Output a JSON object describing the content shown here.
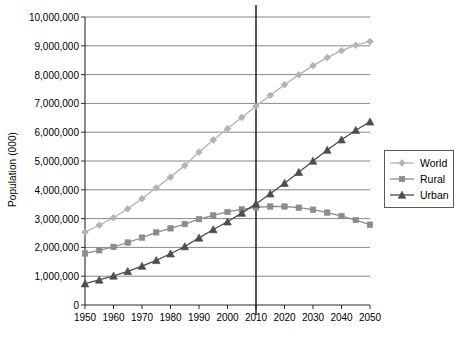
{
  "chart_data": {
    "type": "line",
    "title": "",
    "xlabel": "",
    "ylabel": "Population (000)",
    "xlim": [
      1950,
      2050
    ],
    "ylim": [
      0,
      10000000
    ],
    "grid": true,
    "legend_position": "right",
    "x": [
      1950,
      1955,
      1960,
      1965,
      1970,
      1975,
      1980,
      1985,
      1990,
      1995,
      2000,
      2005,
      2010,
      2015,
      2020,
      2025,
      2030,
      2035,
      2040,
      2045,
      2050
    ],
    "xticks": [
      1950,
      1960,
      1970,
      1980,
      1990,
      2000,
      2010,
      2020,
      2030,
      2040,
      2050
    ],
    "xtick_labels": [
      "1950",
      "1960",
      "1970",
      "1980",
      "1990",
      "2000",
      "2010",
      "2020",
      "2030",
      "2040",
      "2050"
    ],
    "yticks": [
      0,
      1000000,
      2000000,
      3000000,
      4000000,
      5000000,
      6000000,
      7000000,
      8000000,
      9000000,
      10000000
    ],
    "ytick_labels": [
      "0",
      "1,000,000",
      "2,000,000",
      "3,000,000",
      "4,000,000",
      "5,000,000",
      "6,000,000",
      "7,000,000",
      "8,000,000",
      "9,000,000",
      "10,000,000"
    ],
    "annotations": [
      {
        "name": "reference-line-2010",
        "type": "vline",
        "x": 2010
      }
    ],
    "series": [
      {
        "name": "World",
        "marker": "diamond",
        "color": "#b3b3b3",
        "values": [
          2530000,
          2770000,
          3030000,
          3340000,
          3690000,
          4070000,
          4440000,
          4840000,
          5310000,
          5730000,
          6120000,
          6510000,
          6900000,
          7280000,
          7650000,
          7990000,
          8310000,
          8590000,
          8830000,
          9020000,
          9150000
        ]
      },
      {
        "name": "Rural",
        "marker": "square",
        "color": "#8c8c8c",
        "values": [
          1790000,
          1900000,
          2020000,
          2170000,
          2340000,
          2520000,
          2660000,
          2810000,
          2980000,
          3110000,
          3230000,
          3320000,
          3390000,
          3420000,
          3420000,
          3380000,
          3310000,
          3210000,
          3090000,
          2950000,
          2790000
        ]
      },
      {
        "name": "Urban",
        "marker": "triangle",
        "color": "#4d4d4d",
        "values": [
          740000,
          870000,
          1010000,
          1170000,
          1350000,
          1550000,
          1780000,
          2030000,
          2330000,
          2620000,
          2890000,
          3190000,
          3510000,
          3860000,
          4230000,
          4610000,
          5000000,
          5380000,
          5740000,
          6070000,
          6360000
        ]
      }
    ]
  },
  "legend": {
    "items": [
      {
        "label": "World"
      },
      {
        "label": "Rural"
      },
      {
        "label": "Urban"
      }
    ]
  }
}
